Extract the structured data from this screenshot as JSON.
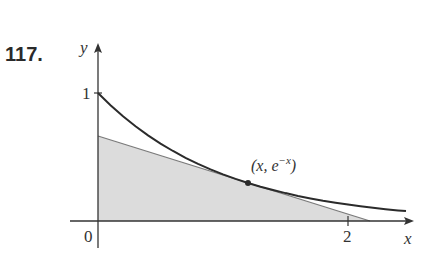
{
  "problem_number": "117.",
  "axes": {
    "x_label": "x",
    "y_label": "y",
    "origin_label": "0",
    "x_tick_label": "2",
    "y_tick_label": "1"
  },
  "curve": {
    "equation": "y = e^(-x)",
    "point_label_prefix": "(x, e",
    "point_label_exp": "−x",
    "point_label_suffix": ")",
    "point_x": 1.2
  },
  "colors": {
    "curve": "#2b2b2b",
    "tangent": "#777777",
    "fill": "#d9d9d9",
    "axes": "#333333"
  }
}
